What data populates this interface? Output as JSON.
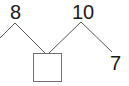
{
  "diagram": {
    "type": "number-bond-tree",
    "nodes": {
      "left_top": {
        "label": "8"
      },
      "right_top": {
        "label": "10"
      },
      "bottom_right": {
        "label": "7"
      },
      "blank": {
        "label": ""
      }
    },
    "colors": {
      "line": "#5a5a5a",
      "text": "#1a1a1a",
      "box_border": "#707070",
      "background": "#ffffff"
    }
  }
}
